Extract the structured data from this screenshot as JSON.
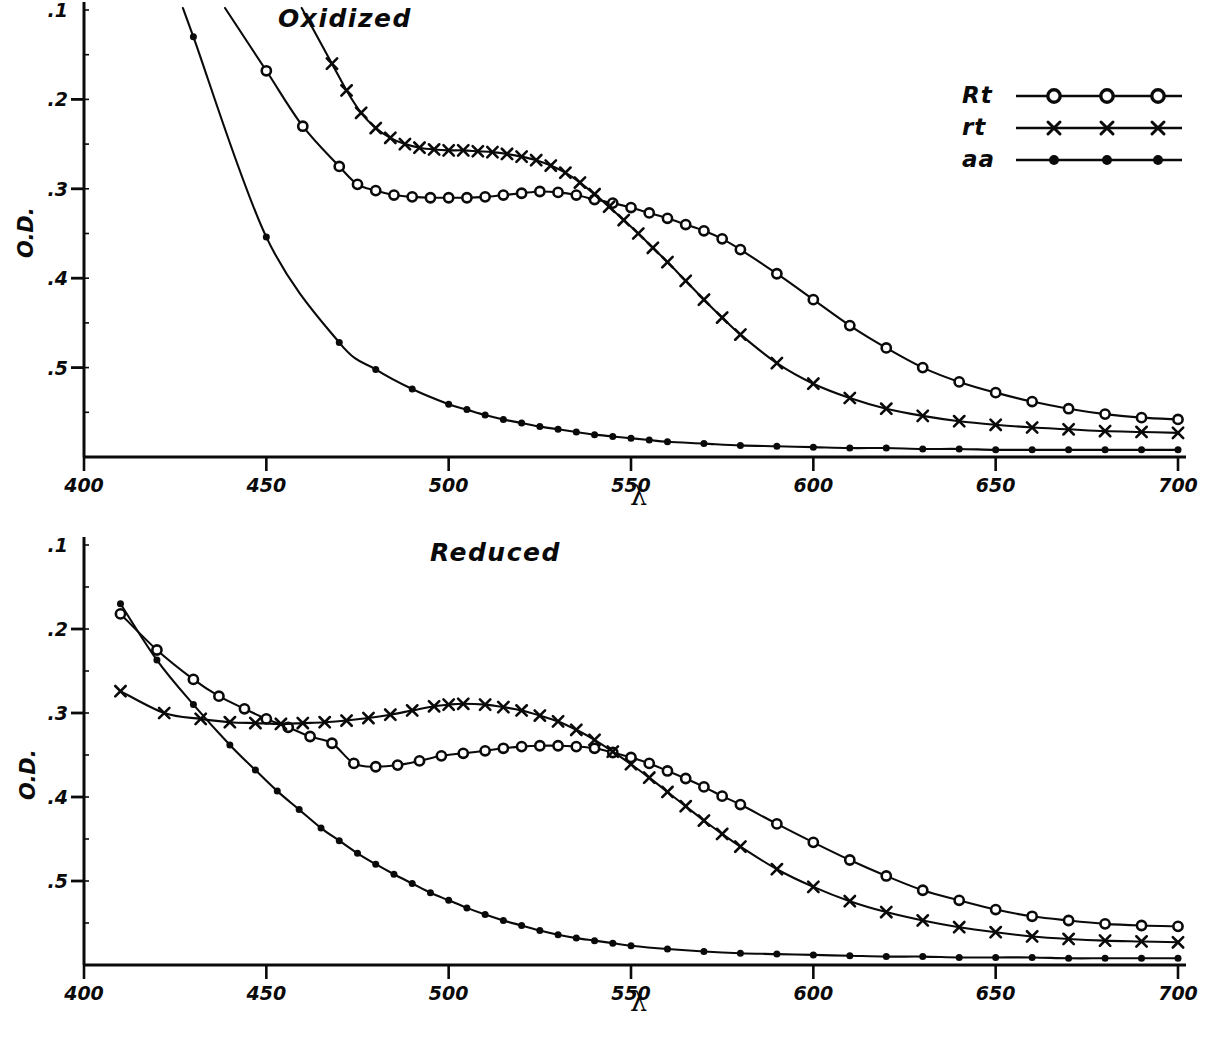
{
  "figure": {
    "y_axis_label": "O.D.",
    "x_axis_label": "λ"
  },
  "legend": {
    "entries": [
      {
        "label": "Rt",
        "marker": "open-circle-marker"
      },
      {
        "label": "rt",
        "marker": "cross-marker"
      },
      {
        "label": "aa",
        "marker": "filled-dot-marker"
      }
    ]
  },
  "panels": [
    {
      "id": "oxidized",
      "title": "Oxidized",
      "x_ticks": [
        "400",
        "450",
        "500",
        "550",
        "600",
        "650",
        "700"
      ],
      "y_ticks": [
        ".5",
        ".4",
        ".3",
        ".2",
        ".1"
      ]
    },
    {
      "id": "reduced",
      "title": "Reduced",
      "x_ticks": [
        "400",
        "450",
        "500",
        "550",
        "600",
        "650",
        "700"
      ],
      "y_ticks": [
        ".5",
        ".4",
        ".3",
        ".2",
        ".1"
      ]
    }
  ],
  "chart_data": [
    {
      "type": "line",
      "title": "Oxidized",
      "xlabel": "λ",
      "ylabel": "O.D.",
      "xlim": [
        400,
        700
      ],
      "ylim": [
        0,
        0.5
      ],
      "xticks": [
        400,
        450,
        500,
        550,
        600,
        650,
        700
      ],
      "yticks": [
        0.1,
        0.2,
        0.3,
        0.4,
        0.5
      ],
      "grid": false,
      "legend_position": "top-right",
      "series": [
        {
          "name": "Rt",
          "marker": "open-circle",
          "x": [
            450,
            460,
            470,
            475,
            480,
            485,
            490,
            495,
            500,
            505,
            510,
            515,
            520,
            525,
            530,
            535,
            540,
            545,
            550,
            555,
            560,
            565,
            570,
            575,
            580,
            590,
            600,
            610,
            620,
            630,
            640,
            650,
            660,
            670,
            680,
            690,
            700
          ],
          "y": [
            0.432,
            0.37,
            0.325,
            0.305,
            0.298,
            0.293,
            0.291,
            0.29,
            0.29,
            0.29,
            0.291,
            0.293,
            0.295,
            0.297,
            0.296,
            0.293,
            0.288,
            0.284,
            0.279,
            0.273,
            0.267,
            0.26,
            0.253,
            0.244,
            0.232,
            0.205,
            0.176,
            0.147,
            0.122,
            0.1,
            0.084,
            0.072,
            0.062,
            0.054,
            0.048,
            0.044,
            0.042
          ]
        },
        {
          "name": "rt",
          "marker": "cross",
          "x": [
            468,
            472,
            476,
            480,
            484,
            488,
            492,
            496,
            500,
            504,
            508,
            512,
            516,
            520,
            524,
            528,
            532,
            536,
            540,
            544,
            548,
            552,
            556,
            560,
            565,
            570,
            575,
            580,
            590,
            600,
            610,
            620,
            630,
            640,
            650,
            660,
            670,
            680,
            690,
            700
          ],
          "y": [
            0.44,
            0.41,
            0.385,
            0.368,
            0.357,
            0.35,
            0.346,
            0.344,
            0.343,
            0.343,
            0.342,
            0.341,
            0.339,
            0.336,
            0.332,
            0.326,
            0.318,
            0.307,
            0.294,
            0.28,
            0.265,
            0.25,
            0.234,
            0.218,
            0.197,
            0.176,
            0.156,
            0.137,
            0.105,
            0.082,
            0.066,
            0.054,
            0.046,
            0.04,
            0.036,
            0.033,
            0.031,
            0.029,
            0.028,
            0.027
          ]
        },
        {
          "name": "aa",
          "marker": "filled-dot",
          "x": [
            430,
            450,
            470,
            480,
            490,
            500,
            505,
            510,
            515,
            520,
            525,
            530,
            535,
            540,
            545,
            550,
            555,
            560,
            570,
            580,
            590,
            600,
            610,
            620,
            630,
            640,
            650,
            660,
            670,
            680,
            690,
            700
          ],
          "y": [
            0.47,
            0.246,
            0.128,
            0.098,
            0.076,
            0.059,
            0.053,
            0.047,
            0.042,
            0.038,
            0.034,
            0.031,
            0.028,
            0.025,
            0.023,
            0.021,
            0.019,
            0.017,
            0.015,
            0.013,
            0.012,
            0.011,
            0.01,
            0.01,
            0.009,
            0.009,
            0.008,
            0.008,
            0.008,
            0.008,
            0.008,
            0.008
          ]
        }
      ]
    },
    {
      "type": "line",
      "title": "Reduced",
      "xlabel": "λ",
      "ylabel": "O.D.",
      "xlim": [
        400,
        700
      ],
      "ylim": [
        0,
        0.5
      ],
      "xticks": [
        400,
        450,
        500,
        550,
        600,
        650,
        700
      ],
      "yticks": [
        0.1,
        0.2,
        0.3,
        0.4,
        0.5
      ],
      "grid": false,
      "legend_position": "none",
      "series": [
        {
          "name": "Rt",
          "marker": "open-circle",
          "x": [
            410,
            420,
            430,
            437,
            444,
            450,
            456,
            462,
            468,
            474,
            480,
            486,
            492,
            498,
            504,
            510,
            515,
            520,
            525,
            530,
            535,
            540,
            545,
            550,
            555,
            560,
            565,
            570,
            575,
            580,
            590,
            600,
            610,
            620,
            630,
            640,
            650,
            660,
            670,
            680,
            690,
            700
          ],
          "y": [
            0.418,
            0.375,
            0.34,
            0.32,
            0.305,
            0.293,
            0.283,
            0.272,
            0.264,
            0.24,
            0.236,
            0.238,
            0.243,
            0.249,
            0.252,
            0.255,
            0.258,
            0.26,
            0.261,
            0.261,
            0.26,
            0.258,
            0.253,
            0.247,
            0.24,
            0.231,
            0.222,
            0.212,
            0.201,
            0.191,
            0.168,
            0.146,
            0.125,
            0.106,
            0.089,
            0.077,
            0.066,
            0.058,
            0.053,
            0.049,
            0.047,
            0.046
          ]
        },
        {
          "name": "rt",
          "marker": "cross",
          "x": [
            410,
            422,
            432,
            440,
            447,
            454,
            460,
            466,
            472,
            478,
            484,
            490,
            496,
            500,
            504,
            510,
            515,
            520,
            525,
            530,
            535,
            540,
            545,
            550,
            555,
            560,
            565,
            570,
            575,
            580,
            590,
            600,
            610,
            620,
            630,
            640,
            650,
            660,
            670,
            680,
            690,
            700
          ],
          "y": [
            0.326,
            0.3,
            0.293,
            0.289,
            0.288,
            0.287,
            0.288,
            0.289,
            0.291,
            0.294,
            0.298,
            0.303,
            0.308,
            0.31,
            0.311,
            0.31,
            0.307,
            0.303,
            0.297,
            0.29,
            0.28,
            0.268,
            0.254,
            0.239,
            0.223,
            0.206,
            0.189,
            0.172,
            0.156,
            0.141,
            0.114,
            0.093,
            0.076,
            0.063,
            0.053,
            0.045,
            0.039,
            0.034,
            0.031,
            0.029,
            0.028,
            0.027
          ]
        },
        {
          "name": "aa",
          "marker": "filled-dot",
          "x": [
            410,
            420,
            430,
            440,
            447,
            453,
            459,
            465,
            470,
            475,
            480,
            485,
            490,
            495,
            500,
            505,
            510,
            515,
            520,
            525,
            530,
            535,
            540,
            545,
            550,
            560,
            570,
            580,
            590,
            600,
            610,
            620,
            630,
            640,
            650,
            660,
            670,
            680,
            690,
            700
          ],
          "y": [
            0.43,
            0.363,
            0.31,
            0.262,
            0.232,
            0.207,
            0.185,
            0.163,
            0.148,
            0.133,
            0.12,
            0.108,
            0.097,
            0.086,
            0.077,
            0.068,
            0.06,
            0.053,
            0.047,
            0.041,
            0.036,
            0.032,
            0.029,
            0.026,
            0.023,
            0.019,
            0.016,
            0.014,
            0.013,
            0.012,
            0.011,
            0.01,
            0.01,
            0.009,
            0.009,
            0.009,
            0.008,
            0.008,
            0.008,
            0.008
          ]
        }
      ]
    }
  ]
}
